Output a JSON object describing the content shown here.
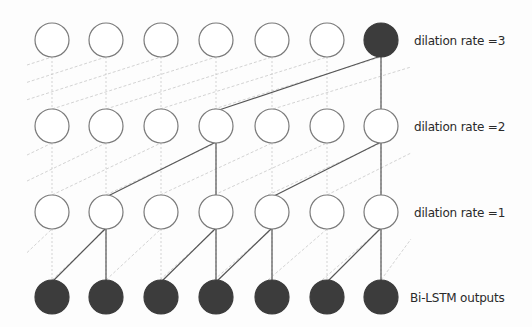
{
  "diagram": {
    "type": "dilated-convolution",
    "columns": 7,
    "column_x": [
      52,
      106,
      161,
      216,
      272,
      327,
      381
    ],
    "radius": 17,
    "rows": [
      {
        "id": "rate3",
        "label": "dilation rate =3",
        "y": 40,
        "filled": [
          6
        ],
        "label_y": 34
      },
      {
        "id": "rate2",
        "label": "dilation rate =2",
        "y": 126,
        "filled": [],
        "label_y": 120
      },
      {
        "id": "rate1",
        "label": "dilation rate =1",
        "y": 212,
        "filled": [],
        "label_y": 206
      },
      {
        "id": "bilstm",
        "label": "Bi-LSTM outputs",
        "y": 297,
        "filled": [
          0,
          1,
          2,
          3,
          4,
          5,
          6
        ],
        "label_y": 291
      }
    ],
    "solid_edges": [
      {
        "from_row": 1,
        "from_col": 6,
        "to_row": 0,
        "to_col": 6
      },
      {
        "from_row": 1,
        "from_col": 3,
        "to_row": 0,
        "to_col": 6
      },
      {
        "from_row": 2,
        "from_col": 3,
        "to_row": 1,
        "to_col": 3
      },
      {
        "from_row": 2,
        "from_col": 1,
        "to_row": 1,
        "to_col": 3
      },
      {
        "from_row": 2,
        "from_col": 6,
        "to_row": 1,
        "to_col": 6
      },
      {
        "from_row": 2,
        "from_col": 4,
        "to_row": 1,
        "to_col": 6
      },
      {
        "from_row": 3,
        "from_col": 1,
        "to_row": 2,
        "to_col": 1
      },
      {
        "from_row": 3,
        "from_col": 0,
        "to_row": 2,
        "to_col": 1
      },
      {
        "from_row": 3,
        "from_col": 3,
        "to_row": 2,
        "to_col": 3
      },
      {
        "from_row": 3,
        "from_col": 2,
        "to_row": 2,
        "to_col": 3
      },
      {
        "from_row": 3,
        "from_col": 4,
        "to_row": 2,
        "to_col": 4
      },
      {
        "from_row": 3,
        "from_col": 3,
        "to_row": 2,
        "to_col": 4
      },
      {
        "from_row": 3,
        "from_col": 6,
        "to_row": 2,
        "to_col": 6
      },
      {
        "from_row": 3,
        "from_col": 5,
        "to_row": 2,
        "to_col": 6
      }
    ],
    "dilations": [
      3,
      2,
      1
    ],
    "colors": {
      "filled": "#3c3c3c",
      "stroke": "#7a7a7a",
      "solid_edge": "#555555",
      "dashed_edge": "#c8c8c8"
    }
  }
}
